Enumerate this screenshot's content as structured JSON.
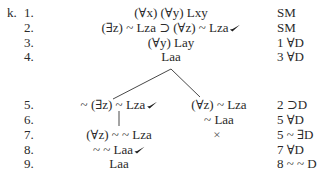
{
  "problem": {
    "label": "k."
  },
  "trunk": [
    {
      "num": "1.",
      "formula": "(∀x) (∀y) Lxy",
      "checked": false,
      "justification": "SM"
    },
    {
      "num": "2.",
      "formula": "(∃z) ~ Lza ⊃ (∀z) ~ Lza",
      "checked": true,
      "justification": "SM"
    },
    {
      "num": "3.",
      "formula": "(∀y) Lay",
      "checked": false,
      "justification": "1 ∀D"
    },
    {
      "num": "4.",
      "formula": "Laa",
      "checked": false,
      "justification": "3 ∀D"
    }
  ],
  "branch_rows": [
    {
      "num": "5.",
      "left": "~ (∃z) ~ Lza",
      "left_checked": true,
      "right": "(∀z) ~ Lza",
      "right_checked": false,
      "justification": "2 ⊃D"
    },
    {
      "num": "6.",
      "left": "",
      "left_checked": false,
      "right": "~ Laa",
      "right_checked": false,
      "justification": "5 ∀D"
    },
    {
      "num": "7.",
      "left": "(∀z) ~ ~ Lza",
      "left_checked": false,
      "right": "×",
      "right_checked": false,
      "justification": "5 ~ ∃D"
    },
    {
      "num": "8.",
      "left": "~ ~ Laa",
      "left_checked": true,
      "right": "",
      "right_checked": false,
      "justification": "7 ∀D"
    },
    {
      "num": "9.",
      "left": "Laa",
      "left_checked": false,
      "right": "",
      "right_checked": false,
      "justification": "8 ~ ~ D"
    }
  ],
  "icons": {
    "check": "check-mark-icon",
    "closed_branch": "x-closed-branch-icon"
  }
}
